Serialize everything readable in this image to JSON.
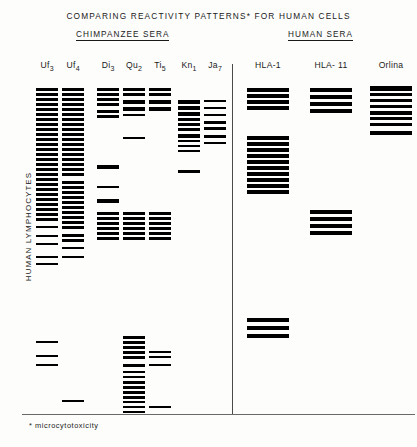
{
  "title": "COMPARING REACTIVITY PATTERNS* FOR HUMAN CELLS",
  "footnote": "* microcytotoxicity",
  "y_axis_label": "HUMAN LYMPHOCYTES",
  "group_headings": [
    {
      "key": "chimpanzee",
      "label": "CHIMPANZEE SERA"
    },
    {
      "key": "human",
      "label": "HUMAN SERA"
    }
  ],
  "colors": {
    "band": "#000000",
    "rule": "#1a1a1a",
    "divider": "#4a4a4a"
  },
  "chart_data": {
    "type": "heatmap",
    "title": "COMPARING REACTIVITY PATTERNS* FOR HUMAN CELLS",
    "xlabel": "",
    "ylabel": "HUMAN LYMPHOCYTES",
    "grid": false,
    "legend": "none",
    "lanes": [
      {
        "name": "Uf3",
        "group": "CHIMPANZEE SERA",
        "x": 36,
        "width": 22,
        "bands": [
          {
            "y": 88,
            "h": 3
          },
          {
            "y": 93,
            "h": 3
          },
          {
            "y": 98,
            "h": 3
          },
          {
            "y": 103,
            "h": 3
          },
          {
            "y": 108,
            "h": 3
          },
          {
            "y": 113,
            "h": 3
          },
          {
            "y": 118,
            "h": 3
          },
          {
            "y": 123,
            "h": 3
          },
          {
            "y": 128,
            "h": 3
          },
          {
            "y": 133,
            "h": 3
          },
          {
            "y": 138,
            "h": 3
          },
          {
            "y": 143,
            "h": 3
          },
          {
            "y": 148,
            "h": 3
          },
          {
            "y": 153,
            "h": 3
          },
          {
            "y": 158,
            "h": 3
          },
          {
            "y": 163,
            "h": 3
          },
          {
            "y": 168,
            "h": 3
          },
          {
            "y": 173,
            "h": 3
          },
          {
            "y": 178,
            "h": 3
          },
          {
            "y": 183,
            "h": 3
          },
          {
            "y": 188,
            "h": 3
          },
          {
            "y": 193,
            "h": 3
          },
          {
            "y": 198,
            "h": 3
          },
          {
            "y": 203,
            "h": 3
          },
          {
            "y": 208,
            "h": 3
          },
          {
            "y": 213,
            "h": 3
          },
          {
            "y": 218,
            "h": 3
          },
          {
            "y": 226,
            "h": 2
          },
          {
            "y": 235,
            "h": 2
          },
          {
            "y": 243,
            "h": 2
          },
          {
            "y": 256,
            "h": 2
          },
          {
            "y": 263,
            "h": 2
          },
          {
            "y": 341,
            "h": 2
          },
          {
            "y": 355,
            "h": 2
          },
          {
            "y": 364,
            "h": 2
          }
        ]
      },
      {
        "name": "Uf4",
        "group": "CHIMPANZEE SERA",
        "x": 62,
        "width": 22,
        "bands": [
          {
            "y": 88,
            "h": 3
          },
          {
            "y": 93,
            "h": 3
          },
          {
            "y": 98,
            "h": 3
          },
          {
            "y": 103,
            "h": 3
          },
          {
            "y": 108,
            "h": 3
          },
          {
            "y": 113,
            "h": 3
          },
          {
            "y": 118,
            "h": 3
          },
          {
            "y": 123,
            "h": 3
          },
          {
            "y": 128,
            "h": 3
          },
          {
            "y": 133,
            "h": 3
          },
          {
            "y": 138,
            "h": 3
          },
          {
            "y": 143,
            "h": 3
          },
          {
            "y": 148,
            "h": 3
          },
          {
            "y": 153,
            "h": 3
          },
          {
            "y": 158,
            "h": 3
          },
          {
            "y": 163,
            "h": 3
          },
          {
            "y": 168,
            "h": 3
          },
          {
            "y": 173,
            "h": 3
          },
          {
            "y": 181,
            "h": 3
          },
          {
            "y": 186,
            "h": 3
          },
          {
            "y": 191,
            "h": 3
          },
          {
            "y": 196,
            "h": 3
          },
          {
            "y": 201,
            "h": 3
          },
          {
            "y": 206,
            "h": 3
          },
          {
            "y": 211,
            "h": 3
          },
          {
            "y": 216,
            "h": 3
          },
          {
            "y": 221,
            "h": 3
          },
          {
            "y": 226,
            "h": 3
          },
          {
            "y": 234,
            "h": 3
          },
          {
            "y": 239,
            "h": 3
          },
          {
            "y": 247,
            "h": 2
          },
          {
            "y": 256,
            "h": 2
          },
          {
            "y": 400,
            "h": 2
          }
        ]
      },
      {
        "name": "Di3",
        "group": "CHIMPANZEE SERA",
        "x": 97,
        "width": 22,
        "bands": [
          {
            "y": 88,
            "h": 3
          },
          {
            "y": 93,
            "h": 3
          },
          {
            "y": 98,
            "h": 3
          },
          {
            "y": 103,
            "h": 3
          },
          {
            "y": 110,
            "h": 3
          },
          {
            "y": 115,
            "h": 3
          },
          {
            "y": 165,
            "h": 4
          },
          {
            "y": 186,
            "h": 2
          },
          {
            "y": 199,
            "h": 4
          },
          {
            "y": 212,
            "h": 3
          },
          {
            "y": 217,
            "h": 3
          },
          {
            "y": 222,
            "h": 3
          },
          {
            "y": 227,
            "h": 3
          },
          {
            "y": 232,
            "h": 3
          },
          {
            "y": 237,
            "h": 3
          }
        ]
      },
      {
        "name": "Qu2",
        "group": "CHIMPANZEE SERA",
        "x": 123,
        "width": 22,
        "bands": [
          {
            "y": 88,
            "h": 3
          },
          {
            "y": 93,
            "h": 3
          },
          {
            "y": 100,
            "h": 4
          },
          {
            "y": 107,
            "h": 4
          },
          {
            "y": 114,
            "h": 2
          },
          {
            "y": 137,
            "h": 2
          },
          {
            "y": 212,
            "h": 3
          },
          {
            "y": 217,
            "h": 3
          },
          {
            "y": 222,
            "h": 3
          },
          {
            "y": 227,
            "h": 3
          },
          {
            "y": 232,
            "h": 3
          },
          {
            "y": 237,
            "h": 3
          },
          {
            "y": 336,
            "h": 3
          },
          {
            "y": 341,
            "h": 3
          },
          {
            "y": 346,
            "h": 3
          },
          {
            "y": 351,
            "h": 3
          },
          {
            "y": 356,
            "h": 3
          },
          {
            "y": 364,
            "h": 3
          },
          {
            "y": 371,
            "h": 2
          },
          {
            "y": 376,
            "h": 2
          },
          {
            "y": 381,
            "h": 3
          },
          {
            "y": 386,
            "h": 3
          },
          {
            "y": 391,
            "h": 3
          },
          {
            "y": 396,
            "h": 3
          },
          {
            "y": 401,
            "h": 2
          },
          {
            "y": 406,
            "h": 2
          },
          {
            "y": 411,
            "h": 2
          }
        ]
      },
      {
        "name": "Ti5",
        "group": "CHIMPANZEE SERA",
        "x": 149,
        "width": 22,
        "bands": [
          {
            "y": 88,
            "h": 3
          },
          {
            "y": 93,
            "h": 3
          },
          {
            "y": 100,
            "h": 4
          },
          {
            "y": 107,
            "h": 4
          },
          {
            "y": 212,
            "h": 3
          },
          {
            "y": 217,
            "h": 3
          },
          {
            "y": 222,
            "h": 3
          },
          {
            "y": 227,
            "h": 3
          },
          {
            "y": 232,
            "h": 3
          },
          {
            "y": 237,
            "h": 3
          },
          {
            "y": 351,
            "h": 2
          },
          {
            "y": 356,
            "h": 2
          },
          {
            "y": 364,
            "h": 2
          },
          {
            "y": 406,
            "h": 2
          }
        ]
      },
      {
        "name": "Kn1",
        "group": "CHIMPANZEE SERA",
        "x": 178,
        "width": 22,
        "bands": [
          {
            "y": 100,
            "h": 4
          },
          {
            "y": 106,
            "h": 4
          },
          {
            "y": 112,
            "h": 4
          },
          {
            "y": 118,
            "h": 3
          },
          {
            "y": 123,
            "h": 3
          },
          {
            "y": 128,
            "h": 3
          },
          {
            "y": 134,
            "h": 4
          },
          {
            "y": 140,
            "h": 2
          },
          {
            "y": 145,
            "h": 2
          },
          {
            "y": 150,
            "h": 2
          },
          {
            "y": 170,
            "h": 3
          }
        ]
      },
      {
        "name": "Ja7",
        "group": "CHIMPANZEE SERA",
        "x": 204,
        "width": 22,
        "bands": [
          {
            "y": 100,
            "h": 2
          },
          {
            "y": 107,
            "h": 2
          },
          {
            "y": 114,
            "h": 2
          },
          {
            "y": 121,
            "h": 3
          },
          {
            "y": 127,
            "h": 3
          },
          {
            "y": 135,
            "h": 3
          },
          {
            "y": 142,
            "h": 2
          }
        ]
      },
      {
        "name": "HLA-1",
        "group": "HUMAN SERA",
        "x": 247,
        "width": 42,
        "bands": [
          {
            "y": 88,
            "h": 4
          },
          {
            "y": 94,
            "h": 4
          },
          {
            "y": 100,
            "h": 4
          },
          {
            "y": 106,
            "h": 4
          },
          {
            "y": 136,
            "h": 4
          },
          {
            "y": 142,
            "h": 4
          },
          {
            "y": 148,
            "h": 4
          },
          {
            "y": 154,
            "h": 4
          },
          {
            "y": 160,
            "h": 4
          },
          {
            "y": 166,
            "h": 4
          },
          {
            "y": 172,
            "h": 4
          },
          {
            "y": 178,
            "h": 4
          },
          {
            "y": 184,
            "h": 4
          },
          {
            "y": 190,
            "h": 4
          },
          {
            "y": 318,
            "h": 4
          },
          {
            "y": 326,
            "h": 4
          },
          {
            "y": 334,
            "h": 4
          }
        ]
      },
      {
        "name": "HLA- 11",
        "group": "HUMAN SERA",
        "x": 310,
        "width": 42,
        "bands": [
          {
            "y": 88,
            "h": 4
          },
          {
            "y": 95,
            "h": 4
          },
          {
            "y": 102,
            "h": 4
          },
          {
            "y": 109,
            "h": 4
          },
          {
            "y": 210,
            "h": 4
          },
          {
            "y": 217,
            "h": 4
          },
          {
            "y": 224,
            "h": 4
          },
          {
            "y": 231,
            "h": 4
          }
        ]
      },
      {
        "name": "Orlina",
        "group": "HUMAN SERA",
        "x": 370,
        "width": 42,
        "bands": [
          {
            "y": 86,
            "h": 5
          },
          {
            "y": 93,
            "h": 3
          },
          {
            "y": 99,
            "h": 3
          },
          {
            "y": 105,
            "h": 3
          },
          {
            "y": 111,
            "h": 4
          },
          {
            "y": 117,
            "h": 3
          },
          {
            "y": 123,
            "h": 3
          },
          {
            "y": 131,
            "h": 4
          }
        ]
      }
    ]
  }
}
